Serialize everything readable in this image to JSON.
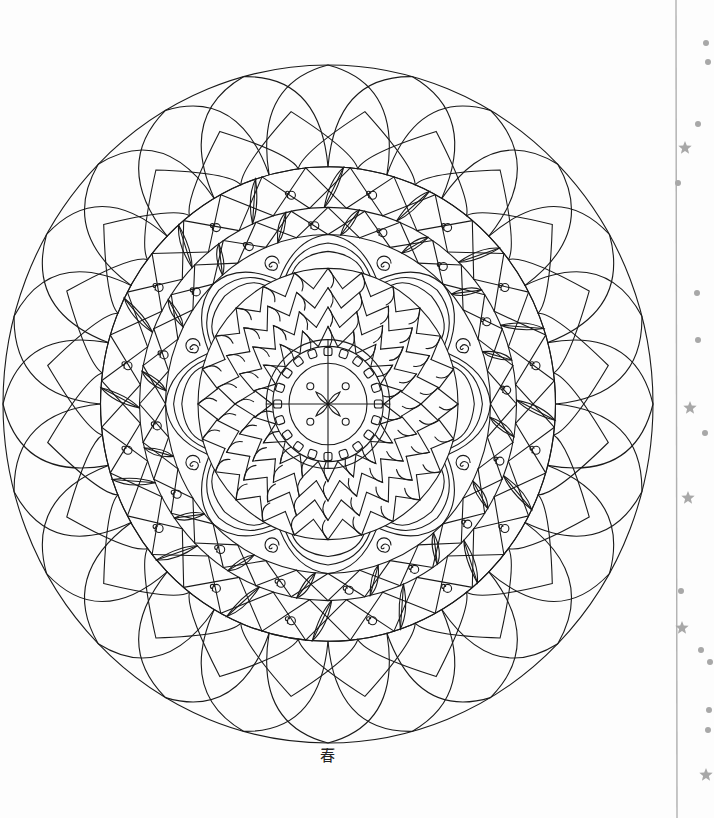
{
  "page": {
    "title": "Mandala coloring page",
    "background": "#fdfdfd",
    "ink_color": "#1a1a1a"
  },
  "mandala": {
    "center": [
      328,
      404
    ],
    "outer_radius": [
      325,
      339
    ],
    "petal_count_outer": 24,
    "rings": [
      {
        "name": "outer-scallop-petals",
        "r": 1.0
      },
      {
        "name": "inner-scallop-petals",
        "r": 0.8
      },
      {
        "name": "leaf-band-1",
        "r": 0.7
      },
      {
        "name": "leaf-band-2",
        "r": 0.58
      },
      {
        "name": "spiral-flower",
        "r": 0.5
      },
      {
        "name": "triangle-mosaic",
        "r": 0.4
      },
      {
        "name": "bead-ring",
        "r": 0.17
      },
      {
        "name": "center-disc",
        "r": 0.12
      }
    ],
    "center_motif": "four-petal cross with dots"
  },
  "signature": {
    "text": "春",
    "position": [
      322,
      758
    ]
  },
  "margin_strip": {
    "line_color": "#b0b0b0",
    "decor_color": "#a8a8a8",
    "stars": [
      [
        685,
        148
      ],
      [
        690,
        408
      ],
      [
        688,
        498
      ],
      [
        682,
        628
      ],
      [
        706,
        775
      ]
    ],
    "dots": [
      [
        706,
        43
      ],
      [
        708,
        62
      ],
      [
        698,
        124
      ],
      [
        678,
        183
      ],
      [
        697,
        293
      ],
      [
        698,
        340
      ],
      [
        705,
        433
      ],
      [
        681,
        591
      ],
      [
        701,
        650
      ],
      [
        710,
        662
      ],
      [
        709,
        710
      ],
      [
        708,
        730
      ]
    ]
  }
}
